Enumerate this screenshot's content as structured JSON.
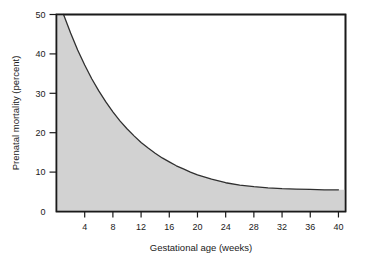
{
  "chart_data": {
    "type": "area",
    "title": "",
    "xlabel": "Gestational age (weeks)",
    "ylabel": "Prenatal mortality (percent)",
    "xlim": [
      0,
      41
    ],
    "ylim": [
      0,
      50
    ],
    "grid": false,
    "legend": null,
    "fill_color": "#d2d2d2",
    "line_color": "#303030",
    "frame_color": "#1a1a1a",
    "background_color": "#ffffff",
    "x_ticks": [
      4,
      8,
      12,
      16,
      20,
      24,
      28,
      32,
      36,
      40
    ],
    "x_tick_labels": [
      "4",
      "8",
      "12",
      "16",
      "20",
      "24",
      "28",
      "32",
      "36",
      "40"
    ],
    "y_ticks": [
      0,
      10,
      20,
      30,
      40,
      50
    ],
    "y_tick_labels": [
      "0",
      "10",
      "20",
      "30",
      "40",
      "50"
    ],
    "series": [
      {
        "name": "Prenatal mortality",
        "x": [
          1,
          2,
          3,
          4,
          5,
          6,
          7,
          8,
          9,
          10,
          11,
          12,
          13,
          14,
          15,
          16,
          17,
          18,
          19,
          20,
          22,
          24,
          26,
          28,
          30,
          32,
          34,
          36,
          38,
          40
        ],
        "values": [
          50.0,
          45.3,
          41.0,
          37.2,
          33.7,
          30.6,
          27.8,
          25.3,
          23.0,
          21.0,
          19.2,
          17.5,
          16.1,
          14.8,
          13.6,
          12.6,
          11.6,
          10.8,
          10.0,
          9.3,
          8.2,
          7.3,
          6.7,
          6.3,
          6.0,
          5.8,
          5.7,
          5.6,
          5.5,
          5.5
        ]
      }
    ],
    "annotations": []
  },
  "axes": {
    "x_title": "Gestational age (weeks)",
    "y_title": "Prenatal mortality (percent)"
  }
}
